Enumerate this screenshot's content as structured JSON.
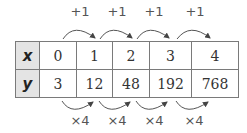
{
  "table": {
    "rows": [
      {
        "header": "x",
        "values": [
          "0",
          "1",
          "2",
          "3",
          "4"
        ]
      },
      {
        "header": "y",
        "values": [
          "3",
          "12",
          "48",
          "192",
          "768"
        ]
      }
    ]
  },
  "top_arrows": {
    "labels": [
      "+1",
      "+1",
      "+1",
      "+1"
    ]
  },
  "bottom_arrows": {
    "labels": [
      "×4",
      "×4",
      "×4",
      "×4"
    ]
  },
  "colors": {
    "border": "#7a7a7a",
    "header_bg": "#e4e4e4",
    "arrow": "#555555"
  }
}
